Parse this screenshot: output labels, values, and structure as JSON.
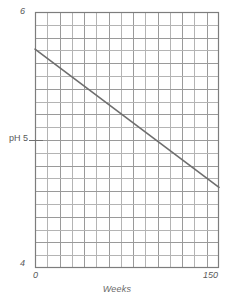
{
  "chart_data": {
    "type": "line",
    "title": "",
    "xlabel": "Weeks",
    "ylabel": "pH",
    "xlim": [
      0,
      150
    ],
    "ylim": [
      4,
      6
    ],
    "grid": true,
    "grid_columns": 15,
    "grid_rows": 20,
    "grid_x_step": 10,
    "grid_y_step": 0.1,
    "legend": "none",
    "x_tick_labels": [
      "0",
      "150"
    ],
    "y_tick_labels": [
      "4",
      "pH 5",
      "6"
    ],
    "y_axis_tick_values": [
      4,
      5,
      6
    ],
    "x_axis_tick_values": [
      0,
      150
    ],
    "series": [
      {
        "name": "pH",
        "x": [
          0,
          150
        ],
        "values": [
          5.71,
          4.63
        ],
        "color": "#6e6e6e",
        "style": "solid",
        "markers": "none"
      }
    ],
    "data_points": [
      {
        "x": 0,
        "y": 5.71
      },
      {
        "x": 150,
        "y": 4.63
      }
    ]
  },
  "axes": {
    "y_max_label": "6",
    "y_mid_label": "pH 5",
    "y_min_label": "4",
    "x_min_label": "0",
    "x_max_label": "150",
    "x_title": "Weeks"
  },
  "colors": {
    "grid_line": "#9a9a9a",
    "grid_line_light": "#b4b4b4",
    "axis_line": "#7d7d7d",
    "series_line": "#6e6e6e",
    "text": "#595959",
    "background": "#ffffff"
  }
}
